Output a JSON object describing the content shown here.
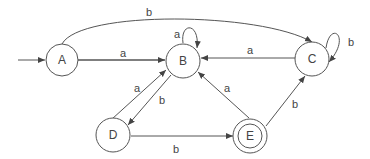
{
  "diagram": {
    "type": "finite-automaton",
    "states": [
      {
        "id": "A",
        "label": "A",
        "start": true,
        "accepting": false
      },
      {
        "id": "B",
        "label": "B",
        "start": false,
        "accepting": false
      },
      {
        "id": "C",
        "label": "C",
        "start": false,
        "accepting": false
      },
      {
        "id": "D",
        "label": "D",
        "start": false,
        "accepting": false
      },
      {
        "id": "E",
        "label": "E",
        "start": false,
        "accepting": true
      }
    ],
    "transitions": [
      {
        "from": "A",
        "to": "B",
        "label": "a"
      },
      {
        "from": "A",
        "to": "C",
        "label": "b"
      },
      {
        "from": "B",
        "to": "B",
        "label": "a"
      },
      {
        "from": "C",
        "to": "B",
        "label": "a"
      },
      {
        "from": "C",
        "to": "C",
        "label": "b"
      },
      {
        "from": "D",
        "to": "B",
        "label": "a"
      },
      {
        "from": "B",
        "to": "D",
        "label": "b"
      },
      {
        "from": "D",
        "to": "E",
        "label": "b"
      },
      {
        "from": "E",
        "to": "B",
        "label": "a"
      },
      {
        "from": "E",
        "to": "C",
        "label": "b"
      }
    ]
  }
}
